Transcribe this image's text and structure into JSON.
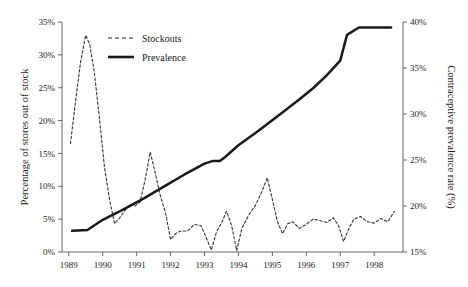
{
  "chart_data": {
    "type": "line",
    "title": "",
    "xlabel": "",
    "ylabel": "Percentage of stores out of stock",
    "y2label": "Contraceptive prevalence rate (%)",
    "xlim": [
      1988.8,
      1998.85
    ],
    "ylim": [
      0,
      35
    ],
    "y2lim": [
      15,
      40
    ],
    "grid": false,
    "legend_position": "top-left-inside",
    "xticks": [
      "1989",
      "1990",
      "1991",
      "1992",
      "1993",
      "1994",
      "1995",
      "1996",
      "1997",
      "1998"
    ],
    "xtick_values": [
      1989,
      1990,
      1991,
      1992,
      1993,
      1994,
      1995,
      1996,
      1997,
      1998
    ],
    "yticks": [
      "0%",
      "5%",
      "10%",
      "15%",
      "20%",
      "25%",
      "30%",
      "35%"
    ],
    "ytick_values": [
      0,
      5,
      10,
      15,
      20,
      25,
      30,
      35
    ],
    "y2ticks": [
      "15%",
      "20%",
      "25%",
      "30%",
      "35%",
      "40%"
    ],
    "y2tick_values": [
      15,
      20,
      25,
      30,
      35,
      40
    ],
    "series": [
      {
        "name": "Stockouts",
        "axis": "left",
        "style": "dashed",
        "color": "#333333",
        "units": "percent",
        "x": [
          1989.05,
          1989.2,
          1989.35,
          1989.5,
          1989.62,
          1989.75,
          1989.9,
          1990.05,
          1990.2,
          1990.35,
          1990.5,
          1990.65,
          1990.8,
          1990.95,
          1991.1,
          1991.25,
          1991.4,
          1991.55,
          1991.7,
          1991.85,
          1992.0,
          1992.15,
          1992.3,
          1992.5,
          1992.7,
          1992.9,
          1993.05,
          1993.2,
          1993.35,
          1993.5,
          1993.65,
          1993.8,
          1993.95,
          1994.1,
          1994.3,
          1994.5,
          1994.7,
          1994.85,
          1995.0,
          1995.15,
          1995.3,
          1995.45,
          1995.6,
          1995.8,
          1996.0,
          1996.2,
          1996.4,
          1996.6,
          1996.8,
          1996.95,
          1997.1,
          1997.25,
          1997.4,
          1997.6,
          1997.8,
          1998.0,
          1998.2,
          1998.4,
          1998.6
        ],
        "values": [
          16.5,
          23.0,
          29.0,
          33.0,
          31.5,
          27.5,
          20.5,
          13.0,
          8.0,
          4.3,
          5.2,
          6.3,
          7.3,
          7.0,
          7.6,
          11.0,
          15.2,
          12.0,
          8.5,
          6.0,
          1.9,
          2.8,
          3.2,
          3.2,
          4.2,
          4.0,
          2.2,
          0.3,
          3.0,
          4.4,
          6.2,
          4.0,
          0.2,
          3.6,
          5.6,
          7.1,
          9.3,
          11.3,
          8.0,
          4.6,
          2.8,
          4.3,
          4.6,
          3.6,
          4.2,
          5.0,
          4.8,
          4.5,
          5.2,
          4.0,
          1.6,
          3.5,
          5.0,
          5.4,
          4.6,
          4.4,
          5.1,
          4.6,
          6.2
        ]
      },
      {
        "name": "Prevalence",
        "axis": "right",
        "style": "solid",
        "color": "#1a1a1a",
        "units": "percent",
        "x": [
          1989.1,
          1989.55,
          1990.0,
          1990.6,
          1991.2,
          1991.8,
          1992.4,
          1993.0,
          1993.25,
          1993.45,
          1993.6,
          1994.0,
          1994.6,
          1995.2,
          1995.8,
          1996.2,
          1996.6,
          1997.0,
          1997.2,
          1997.55,
          1998.5
        ],
        "values": [
          17.3,
          17.4,
          18.5,
          19.6,
          20.8,
          22.1,
          23.4,
          24.6,
          24.9,
          24.9,
          25.3,
          26.6,
          28.2,
          29.9,
          31.6,
          32.8,
          34.2,
          35.8,
          38.6,
          39.4,
          39.4
        ]
      }
    ]
  },
  "legend": {
    "items": [
      {
        "label": "Stockouts",
        "style": "dashed"
      },
      {
        "label": "Prevalence",
        "style": "solid"
      }
    ]
  }
}
